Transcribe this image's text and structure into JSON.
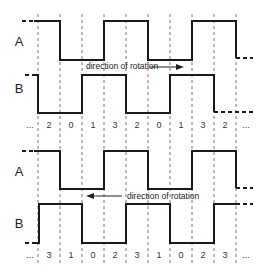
{
  "diagram": {
    "grid_x": [
      38,
      60,
      82,
      104,
      126,
      148,
      170,
      192,
      214,
      236
    ],
    "top": {
      "signal_a_label": "A",
      "signal_b_label": "B",
      "direction_text": "direction of rotation",
      "direction_arrow": "right",
      "states": [
        "...",
        "2",
        "0",
        "1",
        "3",
        "2",
        "0",
        "1",
        "3",
        "2",
        "..."
      ]
    },
    "bottom": {
      "signal_a_label": "A",
      "signal_b_label": "B",
      "direction_text": "direction of rotation",
      "direction_arrow": "left",
      "states": [
        "...",
        "3",
        "1",
        "0",
        "2",
        "3",
        "1",
        "0",
        "2",
        "3",
        "..."
      ]
    }
  }
}
